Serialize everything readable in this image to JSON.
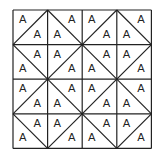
{
  "diagram": {
    "type": "tiling-grid",
    "rows": 4,
    "cols": 4,
    "origin": [
      13,
      10
    ],
    "cell_size": 34.6,
    "line_color": "#222222",
    "background": "#ffffff",
    "triangle_label": "A",
    "cell_diagonals": [
      [
        "/",
        "\\",
        "/",
        "\\"
      ],
      [
        "\\",
        "/",
        "\\",
        "/"
      ],
      [
        "/",
        "\\",
        "/",
        "\\"
      ],
      [
        "\\",
        "/",
        "\\",
        "/"
      ]
    ],
    "labels_per_cell": 2,
    "total_labels": 32
  }
}
